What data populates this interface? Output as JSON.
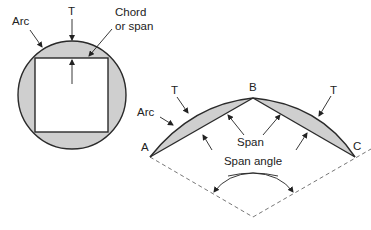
{
  "diagram": {
    "colors": {
      "shade": "#cfcfcf",
      "outline": "#2a2a2a",
      "dash": "#777777",
      "text": "#222222"
    },
    "left_figure": {
      "labels": {
        "arc": "Arc",
        "thickness": "T",
        "chord_line1": "Chord",
        "chord_line2": "or span"
      }
    },
    "right_figure": {
      "labels": {
        "point_a": "A",
        "point_b": "B",
        "point_c": "C",
        "thickness_left": "T",
        "thickness_right": "T",
        "arc": "Arc",
        "span": "Span",
        "span_angle": "Span angle"
      }
    }
  }
}
